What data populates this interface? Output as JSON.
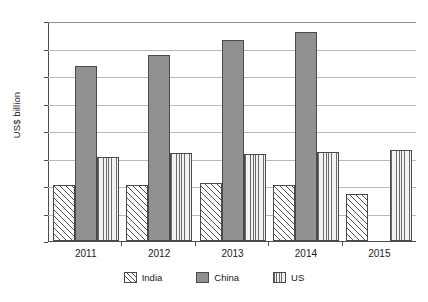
{
  "chart_data": {
    "type": "bar",
    "title": "",
    "xlabel": "",
    "ylabel": "US$ billion",
    "categories": [
      "2011",
      "2012",
      "2013",
      "2014",
      "2015"
    ],
    "series": [
      {
        "name": "India",
        "values": [
          205,
          205,
          210,
          203,
          170
        ]
      },
      {
        "name": "China",
        "values": [
          635,
          675,
          730,
          760,
          null
        ]
      },
      {
        "name": "US",
        "values": [
          305,
          320,
          315,
          325,
          330
        ]
      }
    ],
    "ylim": [
      0,
      800
    ],
    "yticks": [
      0,
      100,
      200,
      300,
      400,
      500,
      600,
      700,
      800
    ],
    "ytick_labels": [
      "0",
      "100",
      "200",
      "300",
      "400",
      "500",
      "600",
      "700",
      "800"
    ],
    "grid": true,
    "legend_position": "bottom-center",
    "legend_entries": [
      "India",
      "China",
      "US"
    ],
    "colors": {
      "india": "#ffffff",
      "china": "#919191",
      "us": "#f2f2f2",
      "outline": "#4a4a4a",
      "gridline": "#b9b9b9",
      "axis": "#4d4d4d",
      "text": "#1a1a1a"
    },
    "patterns": {
      "india": "diagonal-hatch",
      "china": "solid-gray",
      "us": "vertical-lines"
    },
    "background": "#ffffff"
  }
}
